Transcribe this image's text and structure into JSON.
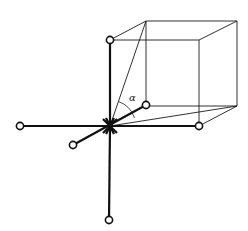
{
  "diagram": {
    "angle_label": "α",
    "colors": {
      "line": "#111111",
      "background": "#ffffff"
    },
    "center": {
      "x": 110,
      "y": 126
    },
    "nodes": [
      {
        "id": "top",
        "x": 110,
        "y": 40
      },
      {
        "id": "left",
        "x": 20,
        "y": 126
      },
      {
        "id": "right",
        "x": 199,
        "y": 126
      },
      {
        "id": "bottom",
        "x": 109,
        "y": 220
      },
      {
        "id": "front-lower-left",
        "x": 73,
        "y": 145
      },
      {
        "id": "back-upper-right",
        "x": 146,
        "y": 105
      }
    ],
    "cube": {
      "front": [
        [
          110,
          40
        ],
        [
          199,
          40
        ],
        [
          199,
          126
        ],
        [
          110,
          126
        ]
      ],
      "back": [
        [
          146,
          21
        ],
        [
          237,
          21
        ],
        [
          237,
          106
        ],
        [
          146,
          106
        ]
      ]
    },
    "diagonals": [
      {
        "from": [
          110,
          126
        ],
        "to": [
          146,
          21
        ]
      },
      {
        "from": [
          110,
          126
        ],
        "to": [
          237,
          106
        ]
      }
    ],
    "label_position": {
      "x": 129,
      "y": 101
    }
  }
}
